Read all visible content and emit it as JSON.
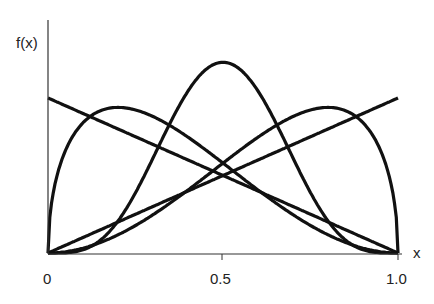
{
  "chart_data": {
    "type": "line",
    "title": "",
    "xlabel": "x",
    "ylabel": "f(x)",
    "xlim": [
      0,
      1
    ],
    "x_ticks": [
      "0",
      "0.5",
      "1.0"
    ],
    "grid": false,
    "legend": null,
    "series": [
      {
        "name": "decreasing-line",
        "kind": "beta",
        "a": 1,
        "b": 2,
        "scale": 1.0
      },
      {
        "name": "increasing-line",
        "kind": "beta",
        "a": 2,
        "b": 1,
        "scale": 1.0
      },
      {
        "name": "symmetric-bell",
        "kind": "beta",
        "a": 5,
        "b": 5,
        "scale": 1.0
      },
      {
        "name": "left-skewed-hump",
        "kind": "beta",
        "a": 1.5,
        "b": 3,
        "scale": 1.0
      },
      {
        "name": "right-skewed-hump",
        "kind": "beta",
        "a": 3,
        "b": 1.5,
        "scale": 1.0
      }
    ]
  },
  "labels": {
    "y_axis": "f(x)",
    "x_axis": "x",
    "tick0": "0",
    "tick1": "0.5",
    "tick2": "1.0"
  }
}
